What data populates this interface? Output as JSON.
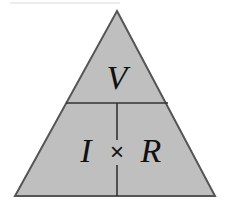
{
  "figure": {
    "kind": "ohms-law-triangle",
    "background_color": "#ffffff",
    "fill_color": "#bfbfbf",
    "stroke_color": "#555555",
    "text_color": "#111111",
    "divider_color": "#333333",
    "canvas": {
      "width": 228,
      "height": 205
    },
    "geometry": {
      "apex": {
        "x": 117,
        "y": 11
      },
      "base_left": {
        "x": 15,
        "y": 196
      },
      "base_right": {
        "x": 215,
        "y": 196
      },
      "horizontal_divider_y": 103,
      "horizontal_divider_x1": 66,
      "horizontal_divider_x2": 168,
      "vertical_divider_x": 117,
      "vertical_divider_y1": 103,
      "vertical_divider_y2": 196
    },
    "cells": {
      "top": {
        "label": "V",
        "meaning": "voltage",
        "x": 117,
        "y": 79,
        "font_size": 34
      },
      "bottom_left": {
        "label": "I",
        "meaning": "current",
        "x": 86,
        "y": 152,
        "font_size": 34
      },
      "operator": {
        "label": "×",
        "meaning": "multiplication-sign",
        "x": 117,
        "y": 152,
        "font_size": 24
      },
      "bottom_right": {
        "label": "R",
        "meaning": "resistance",
        "x": 151,
        "y": 152,
        "font_size": 34
      }
    }
  }
}
